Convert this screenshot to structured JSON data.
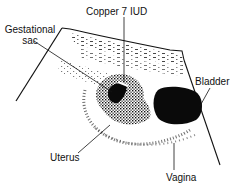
{
  "diagram": {
    "type": "ultrasound-illustration",
    "labels": {
      "copper_iud": "Copper 7 IUD",
      "gestational_sac_line1": "Gestational",
      "gestational_sac_line2": "sac",
      "bladder": "Bladder",
      "uterus": "Uterus",
      "vagina": "Vagina"
    },
    "colors": {
      "ink": "#111111",
      "background": "#ffffff"
    }
  }
}
